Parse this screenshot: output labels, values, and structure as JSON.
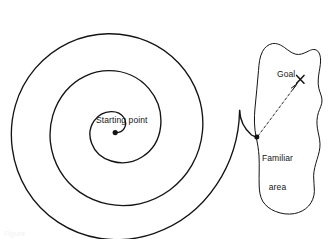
{
  "figure": {
    "domain": "diagram",
    "background_color": "#ffffff",
    "stroke_color": "#141414",
    "text_color": "#141414"
  },
  "labels": {
    "starting_point": "Starting point",
    "goal": "Goal",
    "familiar_area_line1": "Familiar",
    "familiar_area_line2": "area"
  },
  "markers": {
    "start_dot": "start-point-dot",
    "junction_dot": "familiar-area-entry-dot",
    "goal_cross": "goal-cross-marker",
    "arrow_head": "arrowhead-icon"
  },
  "shapes": {
    "spiral_name": "search-spiral-path",
    "blob_name": "familiar-area-blob",
    "arrow_name": "goal-direction-dashed-arrow"
  },
  "caption": {
    "fragment": "Figure"
  }
}
